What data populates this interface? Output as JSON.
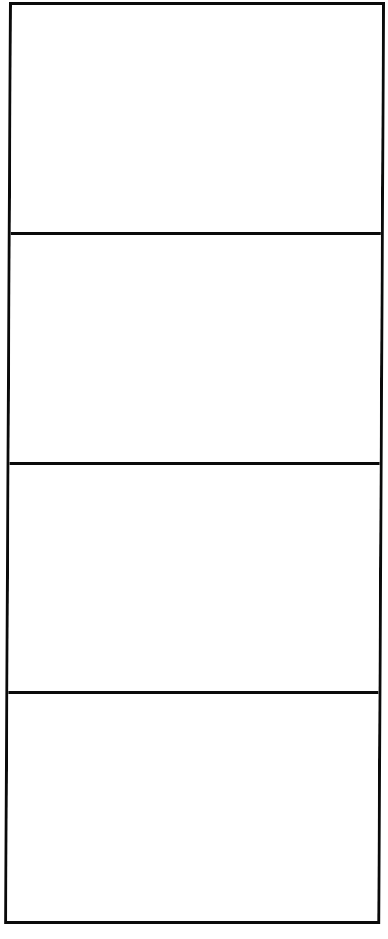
{
  "diagram": {
    "type": "storyboard-template",
    "panel_count": 4,
    "orientation": "vertical",
    "panels": [
      {
        "index": 1,
        "content": ""
      },
      {
        "index": 2,
        "content": ""
      },
      {
        "index": 3,
        "content": ""
      },
      {
        "index": 4,
        "content": ""
      }
    ],
    "colors": {
      "border": "#0a0a0a",
      "background": "#ffffff"
    }
  }
}
